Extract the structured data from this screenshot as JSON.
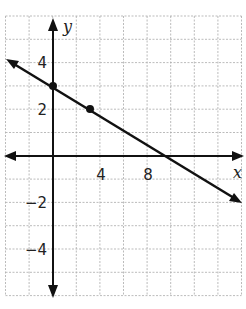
{
  "chart_data": {
    "type": "line",
    "title": "",
    "xlabel": "x",
    "ylabel": "y",
    "xlim": [
      -4,
      16
    ],
    "ylim": [
      -6,
      6
    ],
    "grid": true,
    "x_ticks": [
      {
        "value": 4,
        "label": "4"
      },
      {
        "value": 8,
        "label": "8"
      }
    ],
    "y_ticks": [
      {
        "value": 4,
        "label": "4"
      },
      {
        "value": 2,
        "label": "2"
      },
      {
        "value": -2,
        "label": "−2"
      },
      {
        "value": -4,
        "label": "−4"
      }
    ],
    "series": [
      {
        "name": "line",
        "equation": "y = -x/3 + 3",
        "slope": -0.3333,
        "y_intercept": 3,
        "x_intercept": 9,
        "marked_points": [
          {
            "x": 0,
            "y": 3
          },
          {
            "x": 3,
            "y": 2
          }
        ],
        "arrows": "both ends"
      }
    ]
  }
}
